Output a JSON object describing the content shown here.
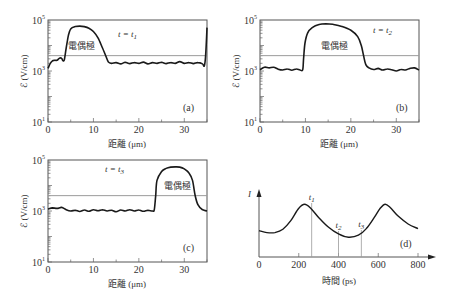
{
  "chart_data": [
    {
      "panel": "(a)",
      "type": "line",
      "time_label": "t = t",
      "time_sub": "1",
      "xlabel": "距離 (μm)",
      "ylabel": "ℰ (V/cm)",
      "xlim": [
        0,
        35
      ],
      "ylim": [
        10,
        100000
      ],
      "yscale": "log",
      "xticks": [
        0,
        10,
        20,
        30
      ],
      "yticks": [
        "10^1",
        "10^3",
        "10^5"
      ],
      "threshold": 4000,
      "annotation": "電偶極",
      "annotation_pos": [
        4.5,
        3.85
      ],
      "log_points": [
        [
          0,
          3.1
        ],
        [
          0.5,
          3.3
        ],
        [
          1,
          3.4
        ],
        [
          1.5,
          3.42
        ],
        [
          2,
          3.42
        ],
        [
          2.5,
          3.5
        ],
        [
          3,
          3.5
        ],
        [
          3.3,
          3.4
        ],
        [
          3.6,
          3.45
        ],
        [
          4,
          3.9
        ],
        [
          4.5,
          4.4
        ],
        [
          5,
          4.65
        ],
        [
          6,
          4.74
        ],
        [
          7,
          4.76
        ],
        [
          8,
          4.74
        ],
        [
          9,
          4.68
        ],
        [
          10,
          4.55
        ],
        [
          11,
          4.3
        ],
        [
          12,
          3.9
        ],
        [
          12.7,
          3.6
        ],
        [
          13.3,
          3.35
        ],
        [
          14,
          3.3
        ],
        [
          15,
          3.33
        ],
        [
          16,
          3.28
        ],
        [
          17,
          3.34
        ],
        [
          18,
          3.29
        ],
        [
          19,
          3.33
        ],
        [
          20,
          3.3
        ],
        [
          21,
          3.35
        ],
        [
          22,
          3.28
        ],
        [
          23,
          3.33
        ],
        [
          24,
          3.3
        ],
        [
          25,
          3.34
        ],
        [
          26,
          3.29
        ],
        [
          27,
          3.33
        ],
        [
          28,
          3.3
        ],
        [
          29,
          3.37
        ],
        [
          30,
          3.3
        ],
        [
          31,
          3.33
        ],
        [
          32,
          3.29
        ],
        [
          33,
          3.33
        ],
        [
          34,
          3.28
        ],
        [
          34.4,
          3.2
        ],
        [
          34.7,
          3.6
        ],
        [
          35,
          4.7
        ]
      ]
    },
    {
      "panel": "(b)",
      "type": "line",
      "time_label": "t = t",
      "time_sub": "2",
      "xlabel": "距離 (μm)",
      "ylabel": "ℰ (V/cm)",
      "xlim": [
        0,
        35
      ],
      "ylim": [
        10,
        100000
      ],
      "yscale": "log",
      "xticks": [
        0,
        10,
        20,
        30
      ],
      "yticks": [
        "10^1",
        "10^3",
        "10^5"
      ],
      "threshold": 4000,
      "annotation": "電偶極",
      "annotation_pos": [
        13.5,
        3.85
      ],
      "log_points": [
        [
          0,
          3.05
        ],
        [
          1,
          3.15
        ],
        [
          2,
          3.12
        ],
        [
          3,
          3.15
        ],
        [
          4,
          3.07
        ],
        [
          5,
          3.04
        ],
        [
          6,
          3.08
        ],
        [
          7,
          3.03
        ],
        [
          8,
          3.08
        ],
        [
          8.8,
          3.04
        ],
        [
          9.4,
          3.05
        ],
        [
          9.6,
          3.5
        ],
        [
          9.9,
          4.1
        ],
        [
          10.5,
          4.5
        ],
        [
          11.5,
          4.7
        ],
        [
          13,
          4.82
        ],
        [
          14.5,
          4.85
        ],
        [
          16,
          4.83
        ],
        [
          18,
          4.75
        ],
        [
          20,
          4.6
        ],
        [
          21.5,
          4.35
        ],
        [
          22.3,
          4.0
        ],
        [
          22.8,
          3.6
        ],
        [
          23.3,
          3.25
        ],
        [
          24,
          3.12
        ],
        [
          25,
          3.06
        ],
        [
          26,
          3.1
        ],
        [
          27,
          3.04
        ],
        [
          28,
          3.08
        ],
        [
          29,
          3.05
        ],
        [
          30,
          3.0
        ],
        [
          31,
          3.06
        ],
        [
          32,
          3.04
        ],
        [
          33,
          3.1
        ],
        [
          34,
          3.12
        ],
        [
          35,
          3.04
        ]
      ]
    },
    {
      "panel": "(c)",
      "type": "line",
      "time_label": "t = t",
      "time_sub": "3",
      "xlabel": "距離 (μm)",
      "ylabel": "ℰ (V/cm)",
      "xlim": [
        0,
        35
      ],
      "ylim": [
        10,
        100000
      ],
      "yscale": "log",
      "xticks": [
        0,
        10,
        20,
        30
      ],
      "yticks": [
        "10^1",
        "10^3",
        "10^5"
      ],
      "threshold": 4000,
      "annotation": "電偶極",
      "annotation_pos": [
        25.5,
        3.85
      ],
      "log_points": [
        [
          0,
          3.08
        ],
        [
          1,
          3.12
        ],
        [
          2,
          3.1
        ],
        [
          3,
          3.14
        ],
        [
          4,
          3.05
        ],
        [
          5,
          3.0
        ],
        [
          6,
          3.03
        ],
        [
          7,
          2.98
        ],
        [
          8,
          3.04
        ],
        [
          9,
          2.99
        ],
        [
          10,
          3.05
        ],
        [
          11,
          3.01
        ],
        [
          12,
          3.05
        ],
        [
          13,
          3.0
        ],
        [
          14,
          3.03
        ],
        [
          15,
          2.97
        ],
        [
          16,
          3.04
        ],
        [
          17,
          3.0
        ],
        [
          18,
          3.05
        ],
        [
          19,
          3.0
        ],
        [
          20,
          3.04
        ],
        [
          21,
          2.99
        ],
        [
          22,
          3.03
        ],
        [
          23,
          3.0
        ],
        [
          23.4,
          3.05
        ],
        [
          23.7,
          3.6
        ],
        [
          24,
          4.2
        ],
        [
          25,
          4.55
        ],
        [
          26,
          4.67
        ],
        [
          27,
          4.72
        ],
        [
          28,
          4.73
        ],
        [
          29,
          4.72
        ],
        [
          30,
          4.65
        ],
        [
          31,
          4.5
        ],
        [
          31.8,
          4.2
        ],
        [
          32.4,
          3.6
        ],
        [
          33,
          3.25
        ],
        [
          34,
          3.05
        ],
        [
          35,
          3.0
        ]
      ]
    },
    {
      "panel": "(d)",
      "type": "line",
      "ylabel": "I",
      "xlabel": "時間 (ps)",
      "xlim": [
        0,
        800
      ],
      "xticks": [
        0,
        200,
        400,
        600,
        800
      ],
      "markers": [
        {
          "label": "t",
          "sub": "1",
          "x": 265
        },
        {
          "label": "t",
          "sub": "2",
          "x": 400
        },
        {
          "label": "t",
          "sub": "3",
          "x": 515
        }
      ],
      "ylim": [
        0,
        1
      ],
      "points": [
        [
          0,
          0.4
        ],
        [
          40,
          0.37
        ],
        [
          80,
          0.37
        ],
        [
          120,
          0.42
        ],
        [
          160,
          0.55
        ],
        [
          200,
          0.74
        ],
        [
          230,
          0.8
        ],
        [
          260,
          0.74
        ],
        [
          300,
          0.6
        ],
        [
          350,
          0.45
        ],
        [
          400,
          0.35
        ],
        [
          450,
          0.3
        ],
        [
          500,
          0.33
        ],
        [
          540,
          0.43
        ],
        [
          580,
          0.6
        ],
        [
          610,
          0.74
        ],
        [
          635,
          0.8
        ],
        [
          660,
          0.75
        ],
        [
          700,
          0.62
        ],
        [
          750,
          0.5
        ],
        [
          800,
          0.43
        ]
      ]
    }
  ],
  "panels": {
    "a": {
      "tag": "(a)",
      "t_prefix": "t = t",
      "t_sub": "1",
      "dipole": "電偶極"
    },
    "b": {
      "tag": "(b)",
      "t_prefix": "t = t",
      "t_sub": "2",
      "dipole": "電偶極"
    },
    "c": {
      "tag": "(c)",
      "t_prefix": "t = t",
      "t_sub": "3",
      "dipole": "電偶極"
    },
    "d": {
      "tag": "(d)",
      "y_axis": "I",
      "t1": "t",
      "t1_sub": "1",
      "t2": "t",
      "t2_sub": "2",
      "t3": "t",
      "t3_sub": "3"
    }
  },
  "axes": {
    "distance_label": "距離 (μm)",
    "field_label": "ℰ (V/cm)",
    "time_label": "時間 (ps)",
    "ytick_base": "10",
    "ytick_exp": [
      "5",
      "3",
      "1"
    ],
    "xticks_um": [
      "0",
      "10",
      "20",
      "30"
    ],
    "xticks_ps": [
      "0",
      "200",
      "400",
      "600",
      "800"
    ]
  },
  "colors": {
    "curve": "#1a1a1a",
    "axis": "#555555",
    "threshold": "#9a9a9a",
    "text": "#333333"
  }
}
